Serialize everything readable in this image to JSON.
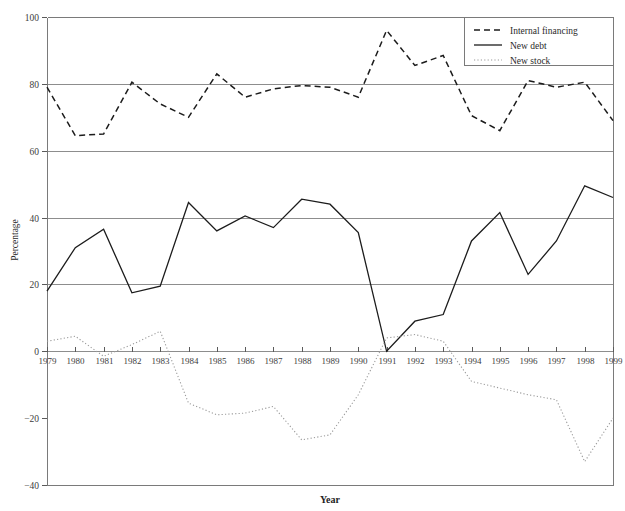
{
  "chart_data": {
    "type": "line",
    "title": "",
    "xlabel": "Year",
    "ylabel": "Percentage",
    "xlim": [
      1979,
      1999
    ],
    "ylim": [
      -40,
      100
    ],
    "yticks": [
      -40,
      -20,
      0,
      20,
      40,
      60,
      80,
      100
    ],
    "grid": "horizontal gridlines at 0, 20, 40, 60, 80",
    "legend_position": "top-right inside plot area",
    "x": [
      1979,
      1980,
      1981,
      1982,
      1983,
      1984,
      1985,
      1986,
      1987,
      1988,
      1989,
      1990,
      1991,
      1992,
      1993,
      1994,
      1995,
      1996,
      1997,
      1998,
      1999
    ],
    "categories": [
      "1979",
      "1980",
      "1981",
      "1982",
      "1983",
      "1984",
      "1985",
      "1986",
      "1987",
      "1988",
      "1989",
      "1990",
      "1991",
      "1992",
      "1993",
      "1994",
      "1995",
      "1996",
      "1997",
      "1998",
      "1999"
    ],
    "series": [
      {
        "name": "Internal financing",
        "style": "dashed",
        "color": "#1c1c1c",
        "values": [
          79,
          64.5,
          65,
          80.5,
          74,
          70,
          83,
          76,
          78.5,
          79.5,
          79,
          76,
          96,
          85.5,
          88.5,
          70.5,
          66,
          81,
          79,
          80.5,
          69
        ]
      },
      {
        "name": "New debt",
        "style": "solid",
        "color": "#1c1c1c",
        "values": [
          18,
          31,
          36.5,
          17.5,
          19.5,
          44.5,
          36,
          40.5,
          37,
          45.5,
          44,
          35.5,
          0,
          9,
          11,
          33,
          41.5,
          23,
          33,
          49.5,
          46
        ]
      },
      {
        "name": "New stock",
        "style": "dotted",
        "color": "#9a9a9a",
        "values": [
          3,
          4.5,
          -1.5,
          2,
          6,
          -15.5,
          -19,
          -18.5,
          -16.5,
          -26.5,
          -25,
          -13,
          4,
          5,
          3,
          -9,
          -11,
          -13,
          -14.5,
          -33,
          -20
        ]
      }
    ]
  },
  "legend": {
    "items": [
      {
        "label": "Internal financing",
        "marker": "dashed-line-swatch"
      },
      {
        "label": "New debt",
        "marker": "solid-line-swatch"
      },
      {
        "label": "New stock",
        "marker": "dotted-line-swatch"
      }
    ]
  },
  "axes": {
    "y_tick_labels": [
      "100",
      "80",
      "60",
      "40",
      "20",
      "0",
      "−20",
      "−40"
    ],
    "x_tick_labels": [
      "1979",
      "1980",
      "1981",
      "1982",
      "1983",
      "1984",
      "1985",
      "1986",
      "1987",
      "1988",
      "1989",
      "1990",
      "1991",
      "1992",
      "1993",
      "1994",
      "1995",
      "1996",
      "1997",
      "1998",
      "1999"
    ],
    "y_axis_title": "Percentage",
    "x_axis_title": "Year"
  }
}
